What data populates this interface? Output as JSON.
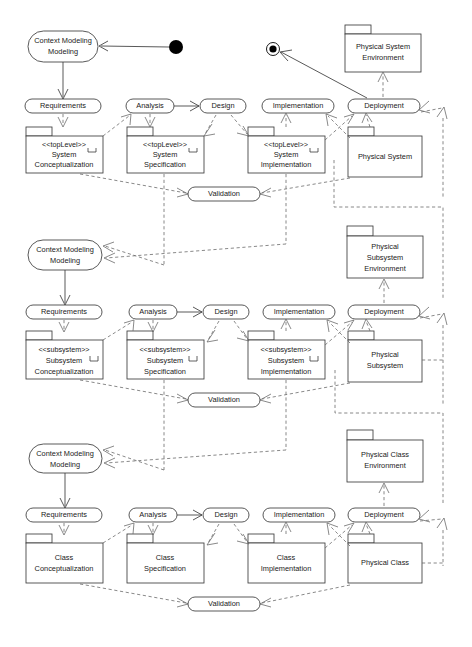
{
  "diagram": {
    "type": "uml-activity-package-diagram",
    "colors": {
      "stroke": "#3b3b3b",
      "dashed": "#6b6b6b",
      "fill": "#ffffff",
      "text": "#1a1a1a"
    }
  },
  "markers": {
    "initial_state": "initial-state-node",
    "final_state": "final-state-node"
  },
  "levels": [
    {
      "id": "system",
      "context_modeling": "Context Modeling",
      "activities": [
        {
          "id": "requirements",
          "label": "Requirements"
        },
        {
          "id": "analysis",
          "label": "Analysis"
        },
        {
          "id": "design",
          "label": "Design"
        },
        {
          "id": "implementation",
          "label": "Implementation"
        },
        {
          "id": "deployment",
          "label": "Deployment"
        }
      ],
      "validation": "Validation",
      "packages": [
        {
          "id": "conceptualization",
          "stereotype": "<<topLevel>>",
          "line1": "System",
          "line2": "Conceptualization",
          "subsystem_icon": true
        },
        {
          "id": "specification",
          "stereotype": "<<topLevel>>",
          "line1": "System",
          "line2": "Specification",
          "subsystem_icon": true
        },
        {
          "id": "implementation-pkg",
          "stereotype": "<<topLevel>>",
          "line1": "System",
          "line2": "Implementation",
          "subsystem_icon": true
        },
        {
          "id": "physical",
          "stereotype": "",
          "line1": "Physical System",
          "line2": "",
          "subsystem_icon": false
        }
      ],
      "environment": {
        "id": "environment",
        "line1": "Physical System",
        "line2": "Environment",
        "line3": ""
      }
    },
    {
      "id": "subsystem",
      "context_modeling": "Context Modeling",
      "activities": [
        {
          "id": "requirements",
          "label": "Requirements"
        },
        {
          "id": "analysis",
          "label": "Analysis"
        },
        {
          "id": "design",
          "label": "Design"
        },
        {
          "id": "implementation",
          "label": "Implementation"
        },
        {
          "id": "deployment",
          "label": "Deployment"
        }
      ],
      "validation": "Validation",
      "packages": [
        {
          "id": "conceptualization",
          "stereotype": "<<subsystem>>",
          "line1": "Subsystem",
          "line2": "Conceptualization",
          "subsystem_icon": true
        },
        {
          "id": "specification",
          "stereotype": "<<subsystem>>",
          "line1": "Subsystem",
          "line2": "Specification",
          "subsystem_icon": true
        },
        {
          "id": "implementation-pkg",
          "stereotype": "<<subsystem>>",
          "line1": "Subsystem",
          "line2": "Implementation",
          "subsystem_icon": true
        },
        {
          "id": "physical",
          "stereotype": "",
          "line1": "Physical",
          "line2": "Subsystem",
          "subsystem_icon": false
        }
      ],
      "environment": {
        "id": "environment",
        "line1": "Physical",
        "line2": "Subsystem",
        "line3": "Environment"
      }
    },
    {
      "id": "class",
      "context_modeling": "Context Modeling",
      "activities": [
        {
          "id": "requirements",
          "label": "Requirements"
        },
        {
          "id": "analysis",
          "label": "Analysis"
        },
        {
          "id": "design",
          "label": "Design"
        },
        {
          "id": "implementation",
          "label": "Implementation"
        },
        {
          "id": "deployment",
          "label": "Deployment"
        }
      ],
      "validation": "Validation",
      "packages": [
        {
          "id": "conceptualization",
          "stereotype": "",
          "line1": "Class",
          "line2": "Conceptualization",
          "subsystem_icon": false
        },
        {
          "id": "specification",
          "stereotype": "",
          "line1": "Class",
          "line2": "Specification",
          "subsystem_icon": false
        },
        {
          "id": "implementation-pkg",
          "stereotype": "",
          "line1": "Class",
          "line2": "Implementation",
          "subsystem_icon": false
        },
        {
          "id": "physical",
          "stereotype": "",
          "line1": "Physical Class",
          "line2": "",
          "subsystem_icon": false
        }
      ],
      "environment": {
        "id": "environment",
        "line1": "Physical Class",
        "line2": "Environment",
        "line3": ""
      }
    }
  ]
}
